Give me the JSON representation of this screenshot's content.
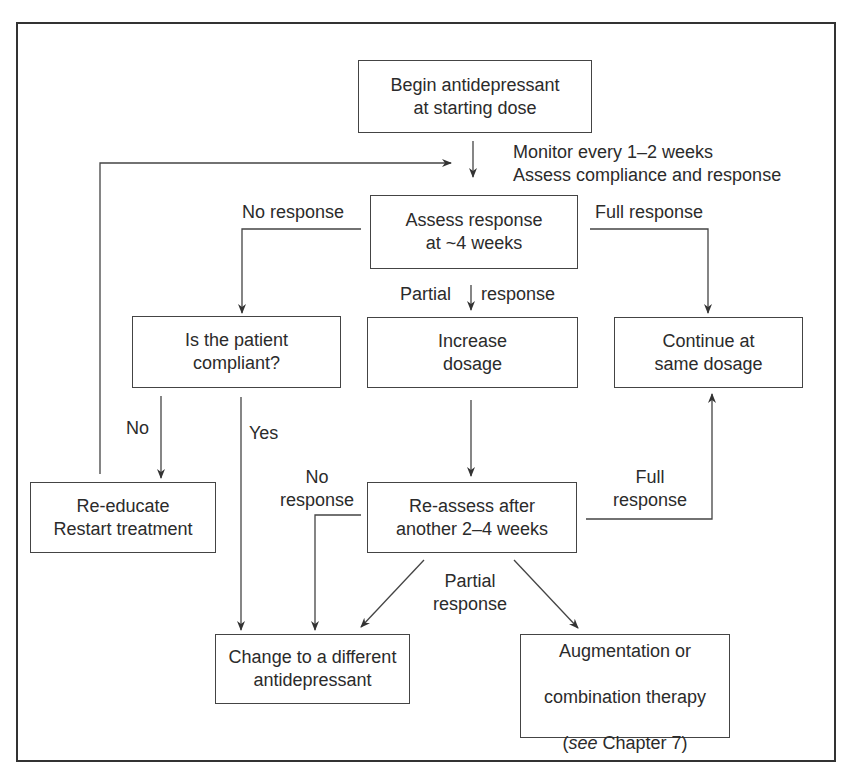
{
  "diagram": {
    "type": "flowchart",
    "nodes": {
      "begin": "Begin antidepressant\nat starting dose",
      "assess": "Assess response\nat ~4 weeks",
      "compliant": "Is the patient\ncompliant?",
      "increase": "Increase\ndosage",
      "continue": "Continue at\nsame dosage",
      "reeducate": "Re-educate\nRestart treatment",
      "reassess": "Re-assess after\nanother 2–4 weeks",
      "change": "Change to a different\nantidepressant",
      "augment_line1": "Augmentation or",
      "augment_line2": "combination therapy",
      "augment_paren_open": "(",
      "augment_see": "see",
      "augment_rest": " Chapter 7)"
    },
    "labels": {
      "monitor": "Monitor every 1–2 weeks\nAssess compliance and response",
      "no_response_1": "No response",
      "full_response_1": "Full response",
      "partial": "Partial",
      "response": "response",
      "no": "No",
      "yes": "Yes",
      "no_response_2": "No\nresponse",
      "full_response_2": "Full\nresponse",
      "partial_response_2": "Partial\nresponse"
    },
    "edges": [
      {
        "from": "begin",
        "to": "assess",
        "label": "Monitor every 1–2 weeks / Assess compliance and response"
      },
      {
        "from": "assess",
        "to": "compliant",
        "label": "No response"
      },
      {
        "from": "assess",
        "to": "increase",
        "label": "Partial response"
      },
      {
        "from": "assess",
        "to": "continue",
        "label": "Full response"
      },
      {
        "from": "compliant",
        "to": "reeducate",
        "label": "No"
      },
      {
        "from": "compliant",
        "to": "change",
        "label": "Yes"
      },
      {
        "from": "reeducate",
        "to": "assess",
        "label": ""
      },
      {
        "from": "increase",
        "to": "reassess",
        "label": ""
      },
      {
        "from": "reassess",
        "to": "change",
        "label": "No response"
      },
      {
        "from": "reassess",
        "to": "continue",
        "label": "Full response"
      },
      {
        "from": "reassess",
        "to": "change",
        "label": "Partial response"
      },
      {
        "from": "reassess",
        "to": "augment",
        "label": "Partial response"
      }
    ]
  }
}
